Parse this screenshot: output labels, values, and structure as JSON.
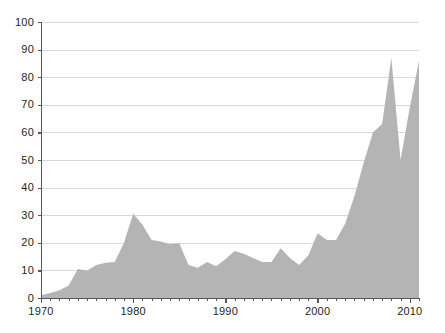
{
  "chart_data": {
    "type": "area",
    "title": "",
    "subtitle": "",
    "xlabel": "",
    "ylabel": "",
    "xlim": [
      1970,
      2011
    ],
    "ylim": [
      0,
      100
    ],
    "grid": true,
    "legend": false,
    "legend_position": "none",
    "series_color": "#b4b4b4",
    "gridline_color": "#d9d9d9",
    "axis_color": "#58585a",
    "text_color": "#231f20",
    "background_color": "#ffffff",
    "y_ticks": [
      0,
      10,
      20,
      30,
      40,
      50,
      60,
      70,
      80,
      90,
      100
    ],
    "y_tick_labels": [
      "0",
      "10",
      "20",
      "30",
      "40",
      "50",
      "60",
      "70",
      "80",
      "90",
      "100"
    ],
    "x_ticks_major": [
      1970,
      1980,
      1990,
      2000,
      2010
    ],
    "x_tick_labels": [
      "1970",
      "1980",
      "1990",
      "2000",
      "2010"
    ],
    "x_minor_tick_interval": 1,
    "x": [
      1970,
      1971,
      1972,
      1973,
      1974,
      1975,
      1976,
      1977,
      1978,
      1979,
      1980,
      1981,
      1982,
      1983,
      1984,
      1985,
      1986,
      1987,
      1988,
      1989,
      1990,
      1991,
      1992,
      1993,
      1994,
      1995,
      1996,
      1997,
      1998,
      1999,
      2000,
      2001,
      2002,
      2003,
      2004,
      2005,
      2006,
      2007,
      2008,
      2009,
      2010,
      2011
    ],
    "values": [
      1.0,
      1.8,
      2.8,
      4.5,
      10.5,
      10.0,
      12.0,
      12.8,
      13.0,
      20.0,
      30.5,
      26.5,
      21.0,
      20.5,
      19.5,
      19.8,
      12.0,
      11.0,
      13.0,
      11.5,
      14.0,
      17.0,
      16.0,
      14.5,
      13.0,
      13.0,
      18.0,
      14.5,
      12.0,
      15.5,
      23.5,
      21.0,
      21.0,
      27.0,
      37.0,
      49.0,
      60.0,
      63.0,
      87.0,
      50.0,
      69.0,
      86.0
    ]
  },
  "axes": {
    "y_axis_name": "value-axis",
    "x_axis_name": "year-axis"
  }
}
